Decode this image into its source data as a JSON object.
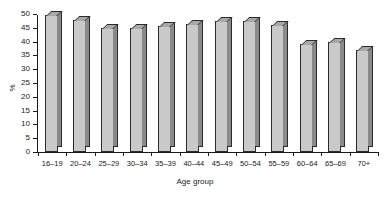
{
  "chart_data": {
    "type": "bar",
    "title": "",
    "subtitle": "",
    "xlabel": "Age group",
    "ylabel": "%",
    "categories": [
      "16–19",
      "20–24",
      "25–29",
      "30–34",
      "35–39",
      "40–44",
      "45–49",
      "50–54",
      "55–59",
      "60–64",
      "65–69",
      "70+"
    ],
    "values": [
      49.5,
      48,
      45,
      45,
      45.5,
      46.5,
      47.5,
      47.5,
      46,
      39,
      40,
      37
    ],
    "ylim": [
      0,
      50
    ],
    "ytick_step": 5,
    "yticks": [
      0,
      5,
      10,
      15,
      20,
      25,
      30,
      35,
      40,
      45,
      50
    ],
    "ytick_labels": [
      "0",
      "5",
      "10",
      "15",
      "20",
      "25",
      "30",
      "35",
      "40",
      "45",
      "50"
    ],
    "grid": false,
    "legend": null,
    "legend_position": "none",
    "series": [
      {
        "name": "",
        "values": [
          49.5,
          48,
          45,
          45,
          45.5,
          46.5,
          47.5,
          47.5,
          46,
          39,
          40,
          37
        ]
      }
    ],
    "colors": {
      "bar_face": "#c9c9c9",
      "bar_side": "#8a8a8a",
      "bar_top": "#a8a8a8",
      "outline": "#2b2b2b",
      "axis": "#1a1a1a",
      "background": "#ffffff"
    }
  }
}
